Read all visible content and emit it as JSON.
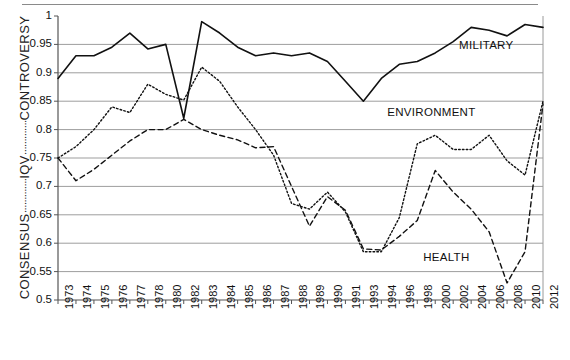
{
  "figure": {
    "y_axis_title_parts": [
      "CONSENSUS",
      "IQV",
      "CONTROVERSY"
    ],
    "y_axis_title_full": "CONSENSUS ------- IQV ------- CONTROVERSY"
  },
  "series_labels": {
    "military": "MILITARY",
    "environment": "ENVIRONMENT",
    "health": "HEALTH"
  },
  "chart_data": {
    "type": "line",
    "title": "",
    "xlabel": "",
    "ylabel": "CONSENSUS ------- IQV ------- CONTROVERSY",
    "ylim": [
      0.5,
      1.0
    ],
    "ytick_labels": [
      "0.5",
      "0.55",
      "0.6",
      "0.65",
      "0.7",
      "0.75",
      "0.8",
      "0.85",
      "0.9",
      "0.95",
      "1"
    ],
    "ytick_values": [
      0.5,
      0.55,
      0.6,
      0.65,
      0.7,
      0.75,
      0.8,
      0.85,
      0.9,
      0.95,
      1.0
    ],
    "grid": true,
    "legend_position": "inline-labels",
    "categories": [
      "1973",
      "1974",
      "1975",
      "1976",
      "1977",
      "1978",
      "1980",
      "1982",
      "1983",
      "1984",
      "1985",
      "1986",
      "1987",
      "1988",
      "1989",
      "1990",
      "1991",
      "1993",
      "1994",
      "1996",
      "1998",
      "2000",
      "2002",
      "2004",
      "2006",
      "2008",
      "2010",
      "2012"
    ],
    "series": [
      {
        "name": "MILITARY",
        "style": "solid",
        "values": [
          0.89,
          0.93,
          0.93,
          0.945,
          0.97,
          0.942,
          0.95,
          0.82,
          0.99,
          0.97,
          0.945,
          0.93,
          0.935,
          0.93,
          0.935,
          0.92,
          0.885,
          0.85,
          0.89,
          0.915,
          0.92,
          0.935,
          0.955,
          0.98,
          0.975,
          0.965,
          0.985,
          0.98
        ]
      },
      {
        "name": "ENVIRONMENT",
        "style": "dotted",
        "values": [
          0.75,
          0.77,
          0.8,
          0.84,
          0.83,
          0.88,
          0.862,
          0.852,
          0.91,
          0.885,
          0.84,
          0.8,
          0.755,
          0.67,
          0.66,
          0.69,
          0.655,
          0.585,
          0.585,
          0.645,
          0.775,
          0.79,
          0.765,
          0.765,
          0.79,
          0.745,
          0.72,
          0.85
        ]
      },
      {
        "name": "HEALTH",
        "style": "dashed",
        "values": [
          0.75,
          0.71,
          0.73,
          0.755,
          0.78,
          0.8,
          0.8,
          0.818,
          0.8,
          0.79,
          0.782,
          0.768,
          0.77,
          0.7,
          0.63,
          0.682,
          0.658,
          0.59,
          0.588,
          0.612,
          0.64,
          0.728,
          0.69,
          0.66,
          0.62,
          0.53,
          0.585,
          0.845
        ]
      }
    ],
    "annotations": [
      {
        "text": "MILITARY",
        "x": 2007,
        "y": 0.945
      },
      {
        "text": "ENVIRONMENT",
        "x": 1998,
        "y": 0.828
      },
      {
        "text": "HEALTH",
        "x": 2002,
        "y": 0.572
      }
    ]
  }
}
